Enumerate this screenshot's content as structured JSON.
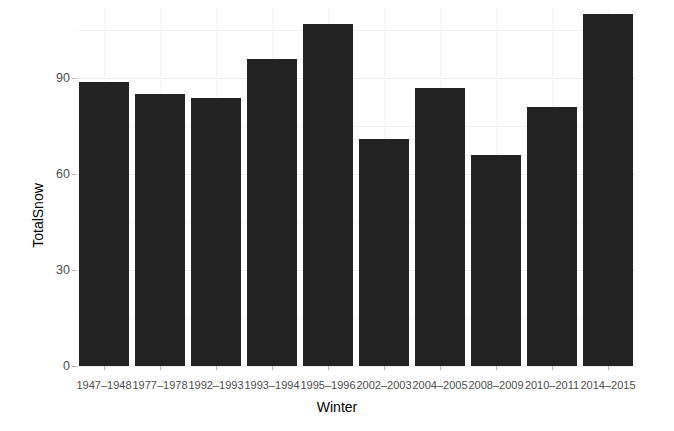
{
  "chart_data": {
    "type": "bar",
    "title": "",
    "xlabel": "Winter",
    "ylabel": "TotalSnow",
    "categories": [
      "1947–1948",
      "1977–1978",
      "1992–1993",
      "1993–1994",
      "1995–1996",
      "2002–2003",
      "2004–2005",
      "2008–2009",
      "2010–2011",
      "2014–2015"
    ],
    "values": [
      89,
      85,
      84,
      96,
      107,
      71,
      87,
      66,
      81,
      110
    ],
    "ylim": [
      0,
      112
    ],
    "yticks": [
      0,
      30,
      60,
      90
    ],
    "ytick_labels": [
      "0",
      "30",
      "60",
      "90"
    ],
    "yminor": [
      15,
      45,
      75,
      105
    ],
    "grid": true,
    "legend": null,
    "bar_color": "#232323",
    "panel_background": "#ffffff",
    "gridline_color": "#ebebeb"
  },
  "axis": {
    "y_title": "TotalSnow",
    "x_title": "Winter"
  }
}
